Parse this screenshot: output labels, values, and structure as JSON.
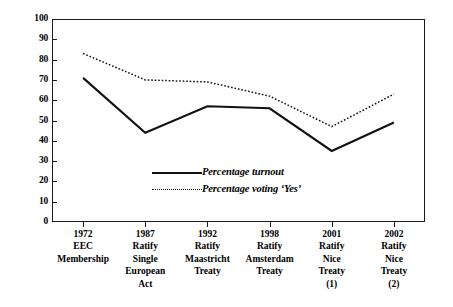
{
  "chart_data": {
    "type": "line",
    "title": "",
    "xlabel": "",
    "ylabel": "",
    "ylim": [
      0,
      100
    ],
    "ytick_step": 10,
    "grid": false,
    "legend_position": "inside-center",
    "categories": [
      "1972",
      "1987",
      "1992",
      "1998",
      "2001",
      "2002"
    ],
    "category_descriptions": [
      [
        "EEC",
        "Membership"
      ],
      [
        "Ratify",
        "Single",
        "European",
        "Act"
      ],
      [
        "Ratify",
        "Maastricht",
        "Treaty"
      ],
      [
        "Ratify",
        "Amsterdam",
        "Treaty"
      ],
      [
        "Ratify",
        "Nice",
        "Treaty",
        "(1)"
      ],
      [
        "Ratify",
        "Nice",
        "Treaty",
        "(2)"
      ]
    ],
    "yticks": [
      "0",
      "10",
      "20",
      "30",
      "40",
      "50",
      "60",
      "70",
      "80",
      "90",
      "100"
    ],
    "series": [
      {
        "name": "Percentage turnout",
        "style": "solid",
        "values": [
          71,
          44,
          57,
          56,
          35,
          49
        ]
      },
      {
        "name": "Percentage voting 'Yes'",
        "style": "dotted",
        "values": [
          83,
          70,
          69,
          62,
          47,
          63
        ]
      }
    ],
    "colors": {
      "line": "#111111",
      "axis": "#1a1a1a",
      "background": "#ffffff"
    }
  },
  "legend": {
    "items": [
      {
        "label": "Percentage turnout",
        "style": "solid"
      },
      {
        "label": "Percentage voting ‘Yes’",
        "style": "dotted"
      }
    ]
  }
}
